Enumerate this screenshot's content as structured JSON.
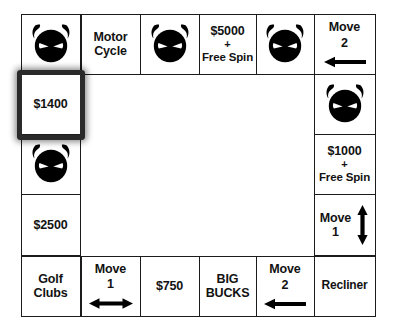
{
  "board": {
    "title": "Game Board",
    "rows": 5,
    "cols": 6,
    "colors": {
      "grid_line": "#1b1b1b",
      "cell_background": "#ffffff",
      "text": "#121212",
      "selection_border": "#2a2a2a",
      "icon": "#000000"
    },
    "cells": {
      "r1c1": {
        "type": "icon",
        "icon": "devil-face-icon",
        "label": ""
      },
      "r1c2": {
        "type": "text",
        "line1": "Motor",
        "line2": "Cycle"
      },
      "r1c3": {
        "type": "icon",
        "icon": "devil-face-icon",
        "label": ""
      },
      "r1c4": {
        "type": "prize",
        "amount": "$5000",
        "plus": "+",
        "bonus": "Free Spin"
      },
      "r1c5": {
        "type": "icon",
        "icon": "devil-face-icon",
        "label": ""
      },
      "r1c6": {
        "type": "move",
        "line1": "Move",
        "line2": "2",
        "arrow": "arrow-left-icon"
      },
      "r2c1": {
        "type": "text",
        "line1": "$1400",
        "selected": true
      },
      "r2c6": {
        "type": "icon",
        "icon": "devil-face-icon",
        "label": ""
      },
      "r3c1": {
        "type": "icon",
        "icon": "devil-face-icon",
        "label": ""
      },
      "r3c6": {
        "type": "prize",
        "amount": "$1000",
        "plus": "+",
        "bonus": "Free Spin"
      },
      "r4c1": {
        "type": "text",
        "line1": "$2500"
      },
      "r4c6": {
        "type": "move",
        "line1": "Move",
        "line2": "1",
        "arrow": "arrow-up-down-icon"
      },
      "r5c1": {
        "type": "text",
        "line1": "Golf",
        "line2": "Clubs"
      },
      "r5c2": {
        "type": "move",
        "line1": "Move",
        "line2": "1",
        "arrow": "arrow-left-right-icon"
      },
      "r5c3": {
        "type": "text",
        "line1": "$750"
      },
      "r5c4": {
        "type": "text",
        "line1": "BIG",
        "line2": "BUCKS"
      },
      "r5c5": {
        "type": "move",
        "line1": "Move",
        "line2": "2",
        "arrow": "arrow-left-icon"
      },
      "r5c6": {
        "type": "text",
        "line1": "Recliner"
      }
    },
    "selection": {
      "cell": "r2c1",
      "value": "$1400"
    }
  }
}
